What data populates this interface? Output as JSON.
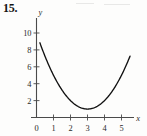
{
  "figure": {
    "problem_number": "15.",
    "x_axis_label": "x",
    "y_axis_label": "y"
  },
  "chart_data": {
    "type": "line",
    "title": "",
    "subtitle": "",
    "xlabel": "x",
    "ylabel": "y",
    "grid": false,
    "legend": false,
    "xlim": [
      0,
      5.8
    ],
    "ylim": [
      0,
      11
    ],
    "x_ticks": [
      0,
      1,
      2,
      3,
      4,
      5
    ],
    "x_tick_labels": [
      "0",
      "1",
      "2",
      "3",
      "4",
      "5"
    ],
    "y_ticks": [
      2,
      4,
      6,
      8,
      10
    ],
    "y_tick_labels": [
      "2",
      "4",
      "6",
      "8",
      "10"
    ],
    "series": [
      {
        "name": "parabola",
        "equation": "y = (x - 3)^2 + 1",
        "vertex": [
          3,
          1
        ],
        "color": "#111111",
        "x": [
          0.2,
          0.5,
          1.0,
          1.5,
          2.0,
          2.5,
          3.0,
          3.5,
          4.0,
          4.5,
          5.0,
          5.5
        ],
        "values": [
          8.84,
          7.25,
          5.0,
          3.25,
          2.0,
          1.25,
          1.0,
          1.25,
          2.0,
          3.25,
          5.0,
          7.25
        ]
      }
    ],
    "annotations": []
  }
}
